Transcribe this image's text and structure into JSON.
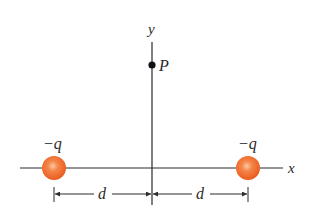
{
  "diagram": {
    "type": "physics-point-charges",
    "colors": {
      "axis": "#2b2b2b",
      "charge_fill": "#f06a2a",
      "charge_highlight": "#fbb48a",
      "text": "#2a2a2a"
    },
    "axes": {
      "x_label": "x",
      "y_label": "y"
    },
    "point": {
      "label": "P"
    },
    "charges": [
      {
        "label": "−q",
        "position": "left"
      },
      {
        "label": "−q",
        "position": "right"
      }
    ],
    "dimensions": [
      {
        "label": "d",
        "span": "left-charge-to-origin"
      },
      {
        "label": "d",
        "span": "origin-to-right-charge"
      }
    ]
  }
}
